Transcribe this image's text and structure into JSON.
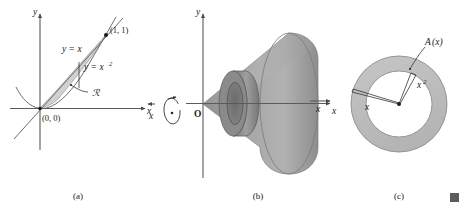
{
  "figure": {
    "title_caption_a": "(a)",
    "title_caption_b": "(b)",
    "title_caption_c": "(c)"
  },
  "panel_a": {
    "axis_y_label": "y",
    "axis_x_label": "x",
    "line_label": "y = x",
    "parabola_label_base": "y = x",
    "parabola_label_exp": "2",
    "point_label": "(1, 1)",
    "origin_label": "(0, 0)",
    "region_label": "ℛ"
  },
  "panel_b": {
    "axis_y_label": "y",
    "axis_x_label": "x",
    "origin_label": "O",
    "rotation_axis_label": "x"
  },
  "panel_c": {
    "area_label_base": "A",
    "area_label_arg": "(x)",
    "outer_radius_label": "x",
    "inner_radius_label_base": "x",
    "inner_radius_label_exp": "2",
    "axis_x_label": "x"
  },
  "colors": {
    "region_gray": "#c9c9c9",
    "solid_light": "#a8a8a8",
    "solid_mid": "#9a9a9a",
    "solid_dark": "#6f6f6f",
    "annulus_band": "#bdbdbd",
    "axis_gray": "#5b5b5b",
    "marker_gray": "#5c5c5c",
    "text_black": "#1a1a1a"
  }
}
